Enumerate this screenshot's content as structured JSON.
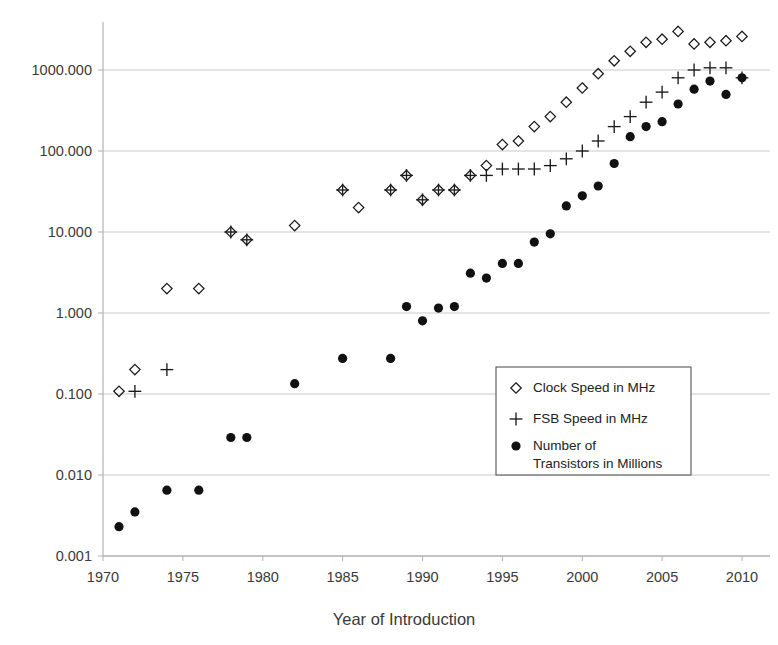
{
  "chart_data": {
    "type": "scatter",
    "title": "",
    "xlabel": "Year of Introduction",
    "ylabel": "",
    "xlim": [
      1970,
      2010
    ],
    "ylim": [
      0.001,
      3000
    ],
    "yscale": "log",
    "grid": true,
    "legend_position": "inside-right-middle",
    "x_ticks": [
      "1970",
      "1975",
      "1980",
      "1985",
      "1990",
      "1995",
      "2000",
      "2005",
      "2010"
    ],
    "x_tick_values": [
      1970,
      1975,
      1980,
      1985,
      1990,
      1995,
      2000,
      2005,
      2010
    ],
    "y_ticks": [
      "0.001",
      "0.010",
      "0.100",
      "1.000",
      "10.000",
      "100.000",
      "1000.000"
    ],
    "y_tick_values": [
      0.001,
      0.01,
      0.1,
      1,
      10,
      100,
      1000
    ],
    "series": [
      {
        "name": "Clock Speed in MHz",
        "marker": "diamond",
        "points": [
          [
            1971,
            0.108
          ],
          [
            1972,
            0.2
          ],
          [
            1974,
            2.0
          ],
          [
            1976,
            2.0
          ],
          [
            1978,
            10.0
          ],
          [
            1979,
            8.0
          ],
          [
            1982,
            12.0
          ],
          [
            1985,
            33.0
          ],
          [
            1986,
            20.0
          ],
          [
            1988,
            33.0
          ],
          [
            1989,
            50.0
          ],
          [
            1990,
            25.0
          ],
          [
            1991,
            33.0
          ],
          [
            1992,
            33.0
          ],
          [
            1993,
            50.0
          ],
          [
            1994,
            66.0
          ],
          [
            1995,
            120.0
          ],
          [
            1996,
            133.0
          ],
          [
            1997,
            200.0
          ],
          [
            1998,
            266.0
          ],
          [
            1999,
            400.0
          ],
          [
            2000,
            600.0
          ],
          [
            2001,
            900.0
          ],
          [
            2002,
            1300.0
          ],
          [
            2003,
            1700.0
          ],
          [
            2004,
            2200.0
          ],
          [
            2005,
            2400.0
          ],
          [
            2006,
            3000.0
          ],
          [
            2007,
            2100.0
          ],
          [
            2008,
            2200.0
          ],
          [
            2009,
            2300.0
          ],
          [
            2010,
            2600.0
          ],
          [
            2011,
            2600.0
          ]
        ]
      },
      {
        "name": "FSB Speed in MHz",
        "marker": "plus",
        "points": [
          [
            1972,
            0.108
          ],
          [
            1974,
            0.2
          ],
          [
            1978,
            10.0
          ],
          [
            1979,
            8.0
          ],
          [
            1985,
            33.0
          ],
          [
            1988,
            33.0
          ],
          [
            1989,
            50.0
          ],
          [
            1990,
            25.0
          ],
          [
            1991,
            33.0
          ],
          [
            1992,
            33.0
          ],
          [
            1993,
            50.0
          ],
          [
            1994,
            50.0
          ],
          [
            1995,
            60.0
          ],
          [
            1996,
            60.0
          ],
          [
            1997,
            60.0
          ],
          [
            1998,
            66.0
          ],
          [
            1999,
            80.0
          ],
          [
            2000,
            100.0
          ],
          [
            2001,
            133.0
          ],
          [
            2002,
            200.0
          ],
          [
            2003,
            266.0
          ],
          [
            2004,
            400.0
          ],
          [
            2005,
            533.0
          ],
          [
            2006,
            800.0
          ],
          [
            2007,
            1000.0
          ],
          [
            2008,
            1066.0
          ],
          [
            2009,
            1066.0
          ],
          [
            2010,
            800.0
          ]
        ]
      },
      {
        "name": "Number of Transistors in Millions",
        "marker": "dot",
        "points": [
          [
            1971,
            0.0023
          ],
          [
            1972,
            0.0035
          ],
          [
            1974,
            0.0065
          ],
          [
            1976,
            0.0065
          ],
          [
            1978,
            0.029
          ],
          [
            1979,
            0.029
          ],
          [
            1982,
            0.134
          ],
          [
            1985,
            0.275
          ],
          [
            1988,
            0.275
          ],
          [
            1989,
            1.2
          ],
          [
            1990,
            0.8
          ],
          [
            1991,
            1.15
          ],
          [
            1992,
            1.2
          ],
          [
            1993,
            3.1
          ],
          [
            1994,
            2.7
          ],
          [
            1995,
            4.1
          ],
          [
            1996,
            4.1
          ],
          [
            1997,
            7.5
          ],
          [
            1998,
            9.5
          ],
          [
            1999,
            21.0
          ],
          [
            2000,
            28.0
          ],
          [
            2001,
            37.0
          ],
          [
            2002,
            70.0
          ],
          [
            2003,
            150.0
          ],
          [
            2004,
            200.0
          ],
          [
            2005,
            230.0
          ],
          [
            2006,
            380.0
          ],
          [
            2007,
            580.0
          ],
          [
            2008,
            730.0
          ],
          [
            2009,
            500.0
          ],
          [
            2010,
            800.0
          ],
          [
            2011,
            600.0
          ]
        ]
      }
    ]
  },
  "legend": {
    "items": [
      {
        "marker": "diamond",
        "label": "Clock Speed in MHz"
      },
      {
        "marker": "plus",
        "label": "FSB Speed in MHz"
      },
      {
        "marker": "dot",
        "label": "Number of",
        "label2": "Transistors in Millions"
      }
    ]
  },
  "axes": {
    "x_title": "Year of Introduction"
  }
}
